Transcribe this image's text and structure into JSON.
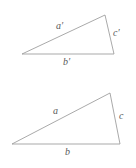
{
  "figure": {
    "background_color": "#ffffff",
    "stroke_color": "#9a9a9a",
    "label_color": "#5a5a5a",
    "triangles": [
      {
        "id": "upper-triangle",
        "name": "primed-triangle",
        "vertices": [
          {
            "name": "left-vertex",
            "x": 22,
            "y": 54
          },
          {
            "name": "apex-vertex",
            "x": 105,
            "y": 15
          },
          {
            "name": "right-vertex",
            "x": 114,
            "y": 54
          }
        ],
        "labels": {
          "hypotenuse": "a′",
          "base": "b′",
          "right_side": "c′"
        }
      },
      {
        "id": "lower-triangle",
        "name": "unprimed-triangle",
        "vertices": [
          {
            "name": "left-vertex",
            "x": 12,
            "y": 144
          },
          {
            "name": "apex-vertex",
            "x": 110,
            "y": 93
          },
          {
            "name": "right-vertex",
            "x": 120,
            "y": 144
          }
        ],
        "labels": {
          "hypotenuse": "a",
          "base": "b",
          "right_side": "c"
        }
      }
    ]
  }
}
